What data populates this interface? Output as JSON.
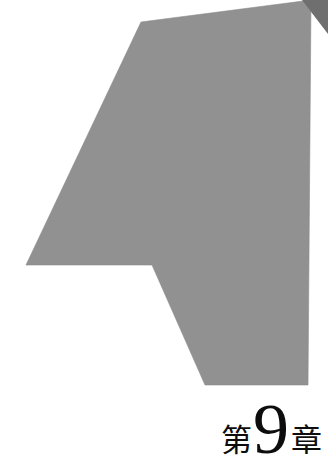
{
  "page": {
    "kind": "book-chapter-opener",
    "background_color": "#ffffff",
    "width": 328,
    "height": 465
  },
  "decoration": {
    "name": "chevron-mark",
    "description": "large stylized letter-A / upward chevron mark",
    "fill_color": "#919191",
    "edge_color": "#8b8b8b",
    "corner_flake_color": "#6f6f6f",
    "points": "141,22 26,265 152,265 205,385 308,385 311,0",
    "corner_flake_points": "328,0 328,34 302,0"
  },
  "chapter_label": {
    "prefix": "第",
    "number": "9",
    "suffix": "章",
    "full_text": "第9章",
    "text_color": "#0d0d0d"
  }
}
